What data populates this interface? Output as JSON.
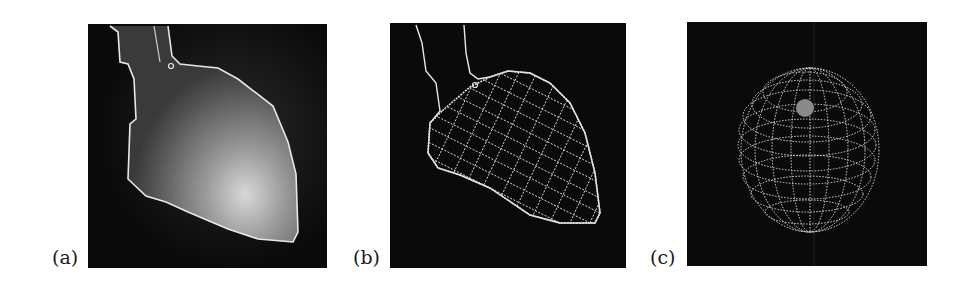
{
  "figure": {
    "panels": [
      {
        "id": "a",
        "label": "(a)",
        "content": "grayscale heart image with traced white contour"
      },
      {
        "id": "b",
        "label": "(b)",
        "content": "contour with fitted wireframe mesh over ventricle"
      },
      {
        "id": "c",
        "label": "(c)",
        "content": "spherical wireframe mesh"
      }
    ]
  },
  "colors": {
    "background": "#ffffff",
    "panel_bg": "#0a0a0a",
    "contour": "#e8e8e8",
    "label_text": "#1a1a1a"
  }
}
